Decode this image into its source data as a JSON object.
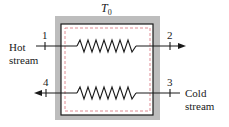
{
  "diagram": {
    "title_label": "T",
    "title_subscript": "0",
    "streams": [
      {
        "name": "Hot",
        "name_line2": "stream",
        "inlet_state": "1",
        "outlet_state": "2",
        "direction": "left-to-right"
      },
      {
        "name": "Cold",
        "name_line2": "stream",
        "inlet_state": "3",
        "outlet_state": "4",
        "direction": "right-to-left"
      }
    ],
    "colors": {
      "insulation": "#b8b8b8",
      "boundary": "#1a1a1a",
      "control_volume": "#d9707a",
      "lines": "#1a1a1a"
    }
  }
}
